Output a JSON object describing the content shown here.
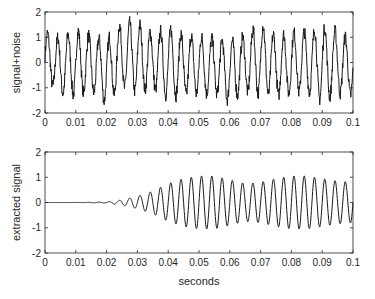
{
  "chart_data": [
    {
      "type": "line",
      "title": "",
      "xlabel": "",
      "ylabel": "signal+noise",
      "xlim": [
        0,
        0.1
      ],
      "ylim": [
        -2,
        2
      ],
      "xticks": [
        "0",
        "0.01",
        "0.02",
        "0.03",
        "0.04",
        "0.05",
        "0.06",
        "0.07",
        "0.08",
        "0.09",
        "0.1"
      ],
      "yticks": [
        "-2",
        "-1",
        "0",
        "1",
        "2"
      ],
      "grid": false,
      "description": "Noisy oscillating signal (~300 Hz sinusoid plus random noise) spanning roughly -2 to 2 across 0 to 0.1 s",
      "series": [
        {
          "name": "signal+noise",
          "x": [
            0,
            0.005,
            0.01,
            0.015,
            0.02,
            0.025,
            0.03,
            0.035,
            0.04,
            0.045,
            0.05,
            0.055,
            0.06,
            0.065,
            0.07,
            0.075,
            0.08,
            0.085,
            0.09,
            0.095,
            0.1
          ],
          "y_envelope_max": [
            1.5,
            1.3,
            1.7,
            1.4,
            1.3,
            2.0,
            2.0,
            1.5,
            1.8,
            1.5,
            1.4,
            1.3,
            1.2,
            1.4,
            2.0,
            1.4,
            1.6,
            1.6,
            1.9,
            1.6,
            1.2
          ],
          "y_envelope_min": [
            -1.0,
            -1.6,
            -1.7,
            -1.5,
            -2.0,
            -1.4,
            -1.6,
            -1.4,
            -1.8,
            -1.7,
            -1.6,
            -1.6,
            -1.9,
            -1.5,
            -1.7,
            -1.7,
            -1.6,
            -1.5,
            -2.0,
            -1.6,
            -1.7
          ]
        }
      ]
    },
    {
      "type": "line",
      "title": "",
      "xlabel": "seconds",
      "ylabel": "extracted signal",
      "xlim": [
        0,
        0.1
      ],
      "ylim": [
        -2,
        2
      ],
      "xticks": [
        "0",
        "0.01",
        "0.02",
        "0.03",
        "0.04",
        "0.05",
        "0.06",
        "0.07",
        "0.08",
        "0.09",
        "0.1"
      ],
      "yticks": [
        "-2",
        "-1",
        "0",
        "1",
        "2"
      ],
      "grid": false,
      "description": "Filtered sinusoid: flat zero until ~0.02 s, then amplitude grows to ~1 by ~0.05 s, dips to ~0.75 around 0.065 s, rises to ~1 near 0.083 s and tapers to ~0.8 at 0.1 s",
      "series": [
        {
          "name": "extracted signal",
          "x": [
            0,
            0.01,
            0.02,
            0.025,
            0.03,
            0.035,
            0.04,
            0.045,
            0.05,
            0.055,
            0.06,
            0.065,
            0.07,
            0.075,
            0.08,
            0.085,
            0.09,
            0.095,
            0.1
          ],
          "amplitude": [
            0,
            0,
            0.02,
            0.1,
            0.25,
            0.45,
            0.75,
            0.95,
            1.05,
            1.05,
            0.9,
            0.75,
            0.8,
            0.95,
            1.05,
            1.05,
            0.95,
            0.85,
            0.8
          ]
        }
      ]
    }
  ],
  "figure": {
    "top_panel": {
      "ylabel": "signal+noise"
    },
    "bottom_panel": {
      "ylabel": "extracted signal",
      "xlabel": "seconds"
    }
  }
}
